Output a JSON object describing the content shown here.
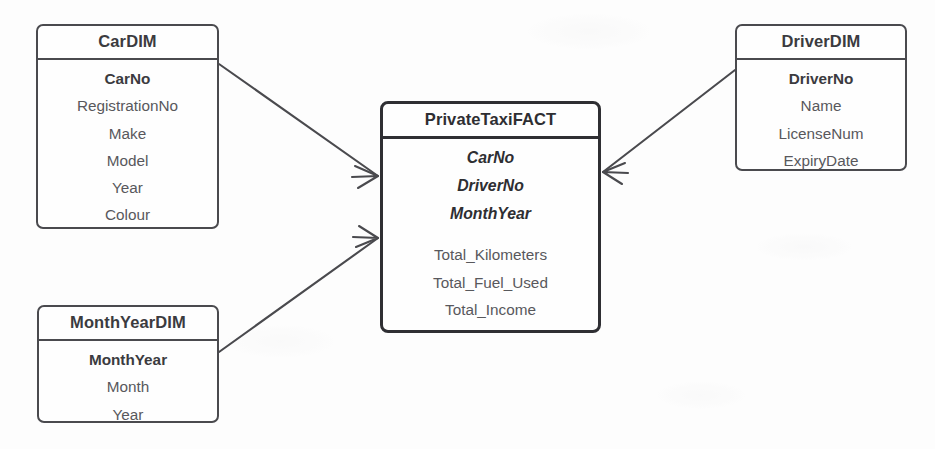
{
  "diagram": {
    "entities": [
      {
        "id": "cardim",
        "name": "CarDIM",
        "kind": "dimension",
        "key": "CarNo",
        "attributes": [
          "RegistrationNo",
          "Make",
          "Model",
          "Year",
          "Colour"
        ]
      },
      {
        "id": "monthyeardim",
        "name": "MonthYearDIM",
        "kind": "dimension",
        "key": "MonthYear",
        "attributes": [
          "Month",
          "Year"
        ]
      },
      {
        "id": "driverdim",
        "name": "DriverDIM",
        "kind": "dimension",
        "key": "DriverNo",
        "attributes": [
          "Name",
          "LicenseNum",
          "ExpiryDate"
        ]
      },
      {
        "id": "fact",
        "name": "PrivateTaxiFACT",
        "kind": "fact",
        "foreign_keys": [
          "CarNo",
          "DriverNo",
          "MonthYear"
        ],
        "measures": [
          "Total_Kilometers",
          "Total_Fuel_Used",
          "Total_Income"
        ]
      }
    ],
    "relationships": [
      {
        "id": "rel-car-fact",
        "from": "cardim",
        "to": "fact",
        "from_cardinality": "one",
        "to_cardinality": "many"
      },
      {
        "id": "rel-monthyear-fact",
        "from": "monthyeardim",
        "to": "fact",
        "from_cardinality": "one",
        "to_cardinality": "many"
      },
      {
        "id": "rel-driver-fact",
        "from": "driverdim",
        "to": "fact",
        "from_cardinality": "one",
        "to_cardinality": "many"
      }
    ],
    "colors": {
      "line": "#4a4a4e",
      "fact_border": "#2f2f33",
      "text": "#3b3b3f",
      "attribute_text": "#58585c",
      "background": "#fdfdfd"
    }
  }
}
